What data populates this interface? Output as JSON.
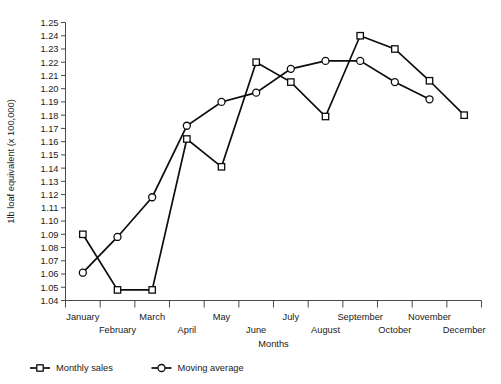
{
  "chart_data": {
    "type": "line",
    "title": "",
    "xlabel": "Months",
    "ylabel": "1lb loaf equivalent (x 100,000)",
    "categories": [
      "January",
      "February",
      "March",
      "April",
      "May",
      "June",
      "July",
      "August",
      "September",
      "October",
      "November",
      "December"
    ],
    "ylim": [
      1.04,
      1.25
    ],
    "ytick_step": 0.01,
    "yticks": [
      "1.25",
      "1.24",
      "1.23",
      "1.22",
      "1.21",
      "1.20",
      "1.19",
      "1.18",
      "1.17",
      "1.16",
      "1.15",
      "1.14",
      "1.13",
      "1.12",
      "1.11",
      "1.10",
      "1.09",
      "1.08",
      "1.07",
      "1.06",
      "1.05",
      "1.04"
    ],
    "grid": false,
    "legend_position": "bottom-left",
    "series": [
      {
        "name": "Monthly sales",
        "marker": "open-square",
        "values": [
          1.09,
          1.048,
          1.048,
          1.162,
          1.141,
          1.22,
          1.205,
          1.179,
          1.24,
          1.23,
          1.206,
          1.18
        ]
      },
      {
        "name": "Moving average",
        "marker": "open-circle",
        "values": [
          1.061,
          1.088,
          1.118,
          1.172,
          1.19,
          1.197,
          1.215,
          1.221,
          1.221,
          1.205,
          1.192,
          null
        ]
      }
    ]
  },
  "legend": {
    "items": [
      {
        "label": "Monthly sales",
        "marker": "open-square"
      },
      {
        "label": "Moving average",
        "marker": "open-circle"
      }
    ]
  }
}
